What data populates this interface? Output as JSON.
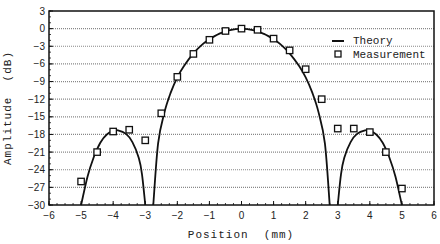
{
  "chart_data": {
    "type": "line",
    "title": "",
    "xlabel": "Position  (mm)",
    "ylabel": "Amplitude  (dB)",
    "xlim": [
      -6,
      6
    ],
    "ylim": [
      -30,
      3
    ],
    "x_ticks": [
      -6,
      -5,
      -4,
      -3,
      -2,
      -1,
      0,
      1,
      2,
      3,
      4,
      5,
      6
    ],
    "y_ticks": [
      3,
      0,
      -3,
      -6,
      -9,
      -12,
      -15,
      -18,
      -21,
      -24,
      -27,
      -30
    ],
    "grid": "horizontal dotted at every y tick",
    "legend": {
      "position": "upper right",
      "entries": [
        "Theory",
        "Measurement"
      ]
    },
    "series": [
      {
        "name": "Theory",
        "style": "solid line",
        "segments": [
          {
            "x": [
              -5.0,
              -4.8,
              -4.6,
              -4.4,
              -4.2,
              -4.0,
              -3.85,
              -3.6,
              -3.4,
              -3.2,
              -3.1,
              -3.0
            ],
            "y": [
              -30,
              -25.2,
              -21.8,
              -19.4,
              -18.0,
              -17.4,
              -17.3,
              -17.9,
              -19.3,
              -22.0,
              -24.8,
              -30
            ]
          },
          {
            "x": [
              -2.75,
              -2.6,
              -2.4,
              -2.2,
              -2.0,
              -1.8,
              -1.5,
              -1.2,
              -1.0,
              -0.7,
              -0.4,
              0,
              0.4,
              0.7,
              1.0,
              1.2,
              1.5,
              1.8,
              2.0,
              2.2,
              2.4,
              2.6,
              2.75
            ],
            "y": [
              -30,
              -19.5,
              -14.2,
              -10.8,
              -8.3,
              -6.4,
              -4.2,
              -2.6,
              -1.8,
              -0.9,
              -0.3,
              0,
              -0.3,
              -0.9,
              -1.8,
              -2.6,
              -4.2,
              -6.4,
              -8.3,
              -10.8,
              -14.2,
              -19.5,
              -30
            ]
          },
          {
            "x": [
              3.0,
              3.1,
              3.2,
              3.4,
              3.6,
              3.85,
              4.0,
              4.2,
              4.4,
              4.6,
              4.8,
              5.0
            ],
            "y": [
              -30,
              -24.8,
              -22.0,
              -19.3,
              -17.9,
              -17.3,
              -17.4,
              -18.0,
              -19.4,
              -21.8,
              -25.2,
              -30
            ]
          }
        ]
      },
      {
        "name": "Measurement",
        "style": "open square markers",
        "x": [
          -5.0,
          -4.5,
          -4.0,
          -3.5,
          -3.0,
          -2.5,
          -2.0,
          -1.5,
          -1.0,
          -0.5,
          0.0,
          0.5,
          1.0,
          1.5,
          2.0,
          2.5,
          3.0,
          3.5,
          4.0,
          4.5,
          5.0
        ],
        "y": [
          -26.0,
          -21.0,
          -17.5,
          -17.2,
          -19.0,
          -14.4,
          -8.2,
          -4.3,
          -1.9,
          -0.4,
          0.0,
          -0.2,
          -1.7,
          -3.7,
          -6.9,
          -12.0,
          -17.0,
          -17.0,
          -17.6,
          -21.0,
          -27.2
        ]
      }
    ]
  },
  "labels": {
    "xlabel": "Position  (mm)",
    "ylabel": "Amplitude  (dB)",
    "legend_theory": "Theory",
    "legend_measurement": "Measurement"
  }
}
